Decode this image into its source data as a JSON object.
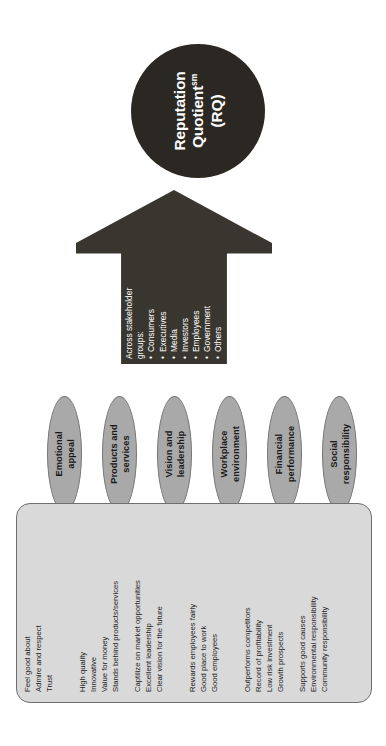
{
  "diagram": {
    "core": {
      "line1": "Reputation",
      "line2": "Quotient",
      "superscript": "sm",
      "line3": "(RQ)",
      "fill_color": "#2b2823",
      "text_color": "#ffffff"
    },
    "arrow": {
      "fill_color": "#393630",
      "text_color": "#ffffff",
      "heading_line1": "Across stakeholder",
      "heading_line2": "groups:",
      "stakeholders": [
        "Consumers",
        "Executives",
        "Media",
        "Investors",
        "Employees",
        "Government",
        "Others"
      ]
    },
    "dimensions": [
      {
        "id": "emotional-appeal",
        "label_line1": "Emotional",
        "label_line2": "appeal",
        "attributes": [
          "Feel good about",
          "Admire and respect",
          "Trust"
        ]
      },
      {
        "id": "products-and-services",
        "label_line1": "Products and",
        "label_line2": "services",
        "attributes": [
          "High quality",
          "Innovative",
          "Value for money",
          "Stands behind products/services"
        ]
      },
      {
        "id": "vision-and-leadership",
        "label_line1": "Vision and",
        "label_line2": "leadership",
        "attributes": [
          "Captilize on market opportunities",
          "Excellent leadership",
          "Clear vision for the future"
        ]
      },
      {
        "id": "workplace-environment",
        "label_line1": "Workplace",
        "label_line2": "environment",
        "attributes": [
          "Rewards employees fairly",
          "Good place to work",
          "Good employees"
        ]
      },
      {
        "id": "financial-performance",
        "label_line1": "Financial",
        "label_line2": "performance",
        "attributes": [
          "Outperforms competitors",
          "Record of profitability",
          "Low risk investment",
          "Growth prospects"
        ]
      },
      {
        "id": "social-responsibility",
        "label_line1": "Social",
        "label_line2": "responsibility",
        "attributes": [
          "Supports good causes",
          "Environmental responsibility",
          "Community responsibility"
        ]
      }
    ],
    "colors": {
      "oval_fill": "#a9a9a9",
      "oval_stroke": "#767676",
      "panel_fill": "#d9d9d9",
      "panel_stroke": "#6f6f6f",
      "background": "#ffffff"
    }
  }
}
